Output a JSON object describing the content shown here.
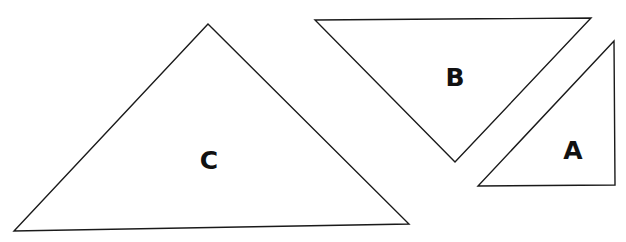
{
  "diagram": {
    "width": 626,
    "height": 242,
    "stroke_color": "#1a1a1a",
    "label_color": "#111111",
    "shapes": [
      {
        "id": "C",
        "label": "C",
        "type": "triangle",
        "points": [
          [
            208,
            24
          ],
          [
            14,
            231
          ],
          [
            409,
            224
          ]
        ],
        "label_pos": [
          209,
          160
        ]
      },
      {
        "id": "B",
        "label": "B",
        "type": "triangle",
        "points": [
          [
            315,
            20
          ],
          [
            591,
            18
          ],
          [
            455,
            162
          ]
        ],
        "label_pos": [
          455,
          77
        ]
      },
      {
        "id": "A",
        "label": "A",
        "type": "triangle",
        "points": [
          [
            614,
            41
          ],
          [
            478,
            186
          ],
          [
            615,
            185
          ]
        ],
        "label_pos": [
          573,
          150
        ]
      }
    ]
  }
}
